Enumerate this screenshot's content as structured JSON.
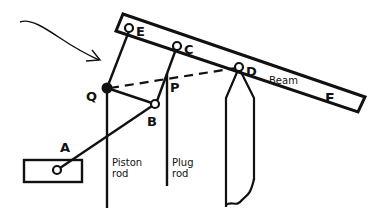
{
  "diagram": {
    "type": "mechanical-linkage",
    "labels": {
      "E": "E",
      "C": "C",
      "D": "D",
      "F": "F",
      "Q": "Q",
      "P": "P",
      "B": "B",
      "A": "A",
      "beam": "Beam",
      "piston_rod_1": "Piston",
      "piston_rod_2": "rod",
      "plug_rod_1": "Plug",
      "plug_rod_2": "rod"
    },
    "points": {
      "E": [
        129,
        28
      ],
      "C": [
        177,
        46
      ],
      "D": [
        239,
        67
      ],
      "Q": [
        107,
        88
      ],
      "B": [
        155,
        104
      ],
      "A": [
        57,
        170
      ]
    },
    "colors": {
      "ink": "#111111",
      "background": "#ffffff"
    }
  }
}
